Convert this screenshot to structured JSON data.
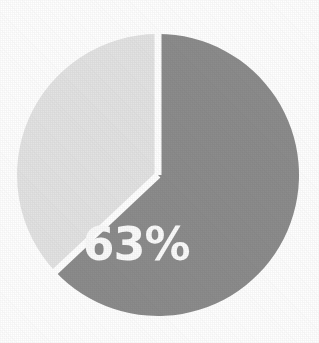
{
  "chart_data": {
    "type": "pie",
    "title": "",
    "subtitle": "",
    "xlabel": "",
    "ylabel": "",
    "grid": false,
    "legend_position": "none",
    "start_angle_deg": 0,
    "direction": "clockwise",
    "categories": [
      "63%",
      "37%"
    ],
    "values": [
      63,
      37
    ],
    "slices": [
      {
        "label": "63%",
        "value": 63,
        "color": "#8c8c8c",
        "label_color": "#fbfbfb",
        "label_shown": true,
        "start_angle_deg": 0,
        "end_angle_deg": 226.8
      },
      {
        "label": "37%",
        "value": 37,
        "color": "#e3e3e3",
        "label_color": "#fbfbfb",
        "label_shown": false,
        "start_angle_deg": 226.8,
        "end_angle_deg": 360
      }
    ],
    "annotations": [
      {
        "text": "63%",
        "x": 136,
        "y": 247
      }
    ]
  },
  "figure": {
    "background_color": "#ffffff",
    "separator_color": "#ffffff",
    "width": 319,
    "height": 343
  },
  "pie": {
    "center_x": 158,
    "center_y": 175,
    "radius": 141,
    "gap_px": 7
  },
  "labels": {
    "major_slice": "63%"
  }
}
